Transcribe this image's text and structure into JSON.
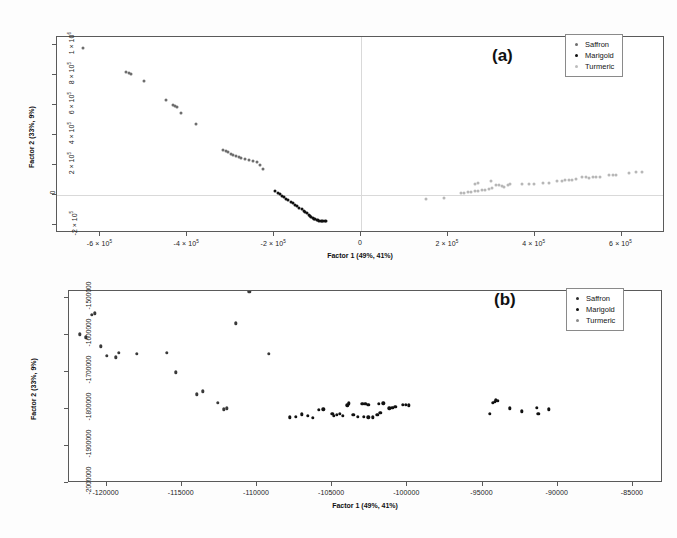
{
  "figure": {
    "panels": [
      "a",
      "b"
    ]
  },
  "panel_a": {
    "tag": "(a)",
    "xlabel": "Factor 1 (49%, 41%)",
    "ylabel": "Factor 2 (33%, 9%)",
    "xticks": [
      "-6 × 10⁵",
      "-4 × 10⁵",
      "-2 × 10⁵",
      "0",
      "2 × 10⁵",
      "4 × 10⁵",
      "6 × 10⁵"
    ],
    "yticks": [
      "1 × 10⁶",
      "8 × 10⁵",
      "6 × 10⁵",
      "4 × 10⁵",
      "2 × 10⁵",
      "0",
      "-2 × 10⁵"
    ],
    "legend": [
      {
        "label": "Saffron",
        "color": "#6e6e6e",
        "key": "saffron"
      },
      {
        "label": "Marigold",
        "color": "#111111",
        "key": "marigold"
      },
      {
        "label": "Turmeric",
        "color": "#bdbdbd",
        "key": "turmeric"
      }
    ]
  },
  "panel_b": {
    "tag": "(b)",
    "xlabel": "Factor 1 (49%, 41%)",
    "ylabel": "Factor 2 (33%, 9%)",
    "xticks": [
      "-120000",
      "-115000",
      "-110000",
      "-105000",
      "-100000",
      "-95000",
      "-90000",
      "-85000"
    ],
    "yticks": [
      "-1500000",
      "-1600000",
      "-1700000",
      "-1800000",
      "-1900000",
      "-2000000"
    ],
    "legend": [
      {
        "label": "Saffron",
        "color": "#2e2e2e",
        "key": "saffron"
      },
      {
        "label": "Marigold",
        "color": "#111111",
        "key": "marigold"
      },
      {
        "label": "Turmeric",
        "color": "#8a8a8a",
        "key": "turmeric"
      }
    ]
  },
  "chart_data": [
    {
      "type": "scatter",
      "title": "(a)",
      "xlabel": "Factor 1 (49%, 41%)",
      "ylabel": "Factor 2 (33%, 9%)",
      "xlim": [
        -700000,
        700000
      ],
      "ylim": [
        -250000,
        1050000
      ],
      "xticks": [
        -600000,
        -400000,
        -200000,
        0,
        200000,
        400000,
        600000
      ],
      "ylim_ticks": [
        1000000,
        800000,
        600000,
        400000,
        200000,
        0,
        -200000
      ],
      "grid": false,
      "legend_position": "top-right",
      "series": [
        {
          "name": "Saffron",
          "color": "#6e6e6e",
          "points": [
            [
              -640000,
              980000
            ],
            [
              -540000,
              820000
            ],
            [
              -534000,
              812000
            ],
            [
              -530000,
              806000
            ],
            [
              -500000,
              760000
            ],
            [
              -450000,
              630000
            ],
            [
              -432000,
              600000
            ],
            [
              -428000,
              592000
            ],
            [
              -424000,
              584000
            ],
            [
              -415000,
              548000
            ],
            [
              -380000,
              470000
            ],
            [
              -318000,
              300000
            ],
            [
              -312000,
              292000
            ],
            [
              -306000,
              284000
            ],
            [
              -300000,
              276000
            ],
            [
              -294000,
              268000
            ],
            [
              -288000,
              262000
            ],
            [
              -282000,
              255000
            ],
            [
              -276000,
              248000
            ],
            [
              -268000,
              242000
            ],
            [
              -258000,
              232000
            ],
            [
              -248000,
              228000
            ],
            [
              -240000,
              222000
            ],
            [
              -232000,
              200000
            ],
            [
              -225000,
              176000
            ]
          ]
        },
        {
          "name": "Marigold",
          "color": "#111111",
          "points": [
            [
              -197000,
              26000
            ],
            [
              -192000,
              16000
            ],
            [
              -187000,
              6000
            ],
            [
              -182000,
              -4000
            ],
            [
              -177000,
              -14000
            ],
            [
              -172000,
              -24000
            ],
            [
              -167000,
              -34000
            ],
            [
              -162000,
              -44000
            ],
            [
              -157000,
              -54000
            ],
            [
              -152000,
              -64000
            ],
            [
              -147000,
              -74000
            ],
            [
              -142000,
              -84000
            ],
            [
              -137000,
              -94000
            ],
            [
              -132000,
              -104000
            ],
            [
              -128000,
              -112000
            ],
            [
              -124000,
              -120000
            ],
            [
              -120000,
              -128000
            ],
            [
              -117000,
              -136000
            ],
            [
              -114000,
              -144000
            ],
            [
              -111000,
              -150000
            ],
            [
              -108000,
              -156000
            ],
            [
              -105000,
              -160000
            ],
            [
              -102000,
              -163000
            ],
            [
              -99000,
              -166000
            ],
            [
              -96000,
              -168000
            ],
            [
              -93000,
              -169000
            ],
            [
              -90000,
              -170000
            ],
            [
              -87000,
              -170000
            ],
            [
              -84000,
              -170000
            ],
            [
              -81000,
              -170000
            ]
          ]
        },
        {
          "name": "Turmeric",
          "color": "#bdbdbd",
          "points": [
            [
              150000,
              -22000
            ],
            [
              190000,
              -16000
            ],
            [
              230000,
              14000
            ],
            [
              238000,
              16000
            ],
            [
              246000,
              19000
            ],
            [
              254000,
              22000
            ],
            [
              262000,
              26000
            ],
            [
              270000,
              30000
            ],
            [
              278000,
              34000
            ],
            [
              286000,
              38000
            ],
            [
              294000,
              42000
            ],
            [
              302000,
              46000
            ],
            [
              262000,
              78000
            ],
            [
              270000,
              80000
            ],
            [
              300000,
              94000
            ],
            [
              312000,
              70000
            ],
            [
              318000,
              66000
            ],
            [
              324000,
              62000
            ],
            [
              330000,
              58000
            ],
            [
              338000,
              66000
            ],
            [
              344000,
              72000
            ],
            [
              370000,
              74000
            ],
            [
              386000,
              76000
            ],
            [
              398000,
              78000
            ],
            [
              420000,
              82000
            ],
            [
              434000,
              84000
            ],
            [
              452000,
              92000
            ],
            [
              462000,
              96000
            ],
            [
              470000,
              100000
            ],
            [
              478000,
              104000
            ],
            [
              486000,
              102000
            ],
            [
              494000,
              106000
            ],
            [
              510000,
              120000
            ],
            [
              518000,
              122000
            ],
            [
              526000,
              118000
            ],
            [
              534000,
              124000
            ],
            [
              542000,
              120000
            ],
            [
              550000,
              122000
            ],
            [
              572000,
              134000
            ],
            [
              580000,
              138000
            ],
            [
              588000,
              136000
            ],
            [
              616000,
              146000
            ],
            [
              634000,
              152000
            ],
            [
              648000,
              156000
            ]
          ]
        }
      ]
    },
    {
      "type": "scatter",
      "title": "(b)",
      "xlabel": "Factor 1 (49%, 41%)",
      "ylabel": "Factor 2 (33%, 9%)",
      "xlim": [
        -122500,
        -83000
      ],
      "ylim": [
        -2000000,
        -1480000
      ],
      "xticks": [
        -120000,
        -115000,
        -110000,
        -105000,
        -100000,
        -95000,
        -90000,
        -85000
      ],
      "ylim_ticks": [
        -1500000,
        -1600000,
        -1700000,
        -1800000,
        -1900000,
        -2000000
      ],
      "grid": false,
      "legend_position": "top-right",
      "series": [
        {
          "name": "Turmeric",
          "color": "#3a3a3a",
          "points": [
            [
              -121800,
              -1597000
            ],
            [
              -121400,
              -1605000
            ],
            [
              -121000,
              -1545000
            ],
            [
              -120800,
              -1540000
            ],
            [
              -120400,
              -1630000
            ],
            [
              -120000,
              -1655000
            ],
            [
              -119400,
              -1660000
            ],
            [
              -119200,
              -1648000
            ],
            [
              -118000,
              -1650000
            ],
            [
              -116000,
              -1648000
            ],
            [
              -115400,
              -1700000
            ],
            [
              -114000,
              -1760000
            ],
            [
              -113600,
              -1752000
            ],
            [
              -112600,
              -1782000
            ],
            [
              -112200,
              -1800000
            ],
            [
              -112000,
              -1798000
            ],
            [
              -111400,
              -1568000
            ],
            [
              -110500,
              -1482000
            ],
            [
              -109200,
              -1650000
            ]
          ]
        },
        {
          "name": "Marigold",
          "color": "#111111",
          "points": [
            [
              -107800,
              -1822000
            ],
            [
              -107400,
              -1820000
            ],
            [
              -107000,
              -1814000
            ],
            [
              -106600,
              -1818000
            ],
            [
              -106300,
              -1824000
            ],
            [
              -105900,
              -1802000
            ],
            [
              -105600,
              -1800000
            ],
            [
              -105000,
              -1812000
            ],
            [
              -104900,
              -1818000
            ],
            [
              -104700,
              -1816000
            ],
            [
              -104500,
              -1812000
            ],
            [
              -104300,
              -1818000
            ],
            [
              -104000,
              -1790000
            ],
            [
              -103900,
              -1784000
            ],
            [
              -103600,
              -1816000
            ],
            [
              -103300,
              -1820000
            ],
            [
              -103000,
              -1786000
            ],
            [
              -102800,
              -1786000
            ],
            [
              -102600,
              -1788000
            ],
            [
              -102900,
              -1820000
            ],
            [
              -102600,
              -1822000
            ],
            [
              -102300,
              -1822000
            ],
            [
              -102000,
              -1816000
            ],
            [
              -101800,
              -1810000
            ],
            [
              -101900,
              -1786000
            ],
            [
              -101600,
              -1784000
            ],
            [
              -101200,
              -1798000
            ],
            [
              -101000,
              -1796000
            ],
            [
              -100800,
              -1794000
            ],
            [
              -100300,
              -1788000
            ],
            [
              -100100,
              -1788000
            ],
            [
              -99900,
              -1790000
            ],
            [
              -94200,
              -1780000
            ],
            [
              -94100,
              -1776000
            ],
            [
              -94000,
              -1778000
            ],
            [
              -94300,
              -1782000
            ],
            [
              -94500,
              -1812000
            ],
            [
              -93200,
              -1798000
            ],
            [
              -92400,
              -1806000
            ],
            [
              -91400,
              -1796000
            ],
            [
              -91300,
              -1812000
            ],
            [
              -90600,
              -1800000
            ]
          ]
        }
      ]
    }
  ]
}
